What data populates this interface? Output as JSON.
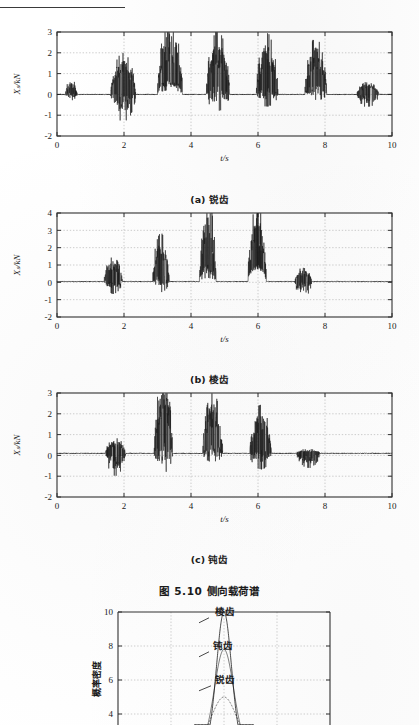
{
  "page": {
    "figure_caption": "图 5.10    侧向载荷谱",
    "header_rule": "horizontal-rule"
  },
  "subcaptions": {
    "a": "(a) 锐齿",
    "b": "(b) 棱齿",
    "c": "(c) 钝齿"
  },
  "chart_data": [
    {
      "id": "panel-a",
      "type": "line",
      "title": "(a) 锐齿",
      "xlabel": "t/s",
      "ylabel": "Xₛ/kN",
      "xlim": [
        0,
        10
      ],
      "ylim": [
        -2,
        3
      ],
      "xticks": [
        0,
        2,
        4,
        6,
        8,
        10
      ],
      "yticks": [
        -2,
        -1,
        0,
        1,
        2,
        3
      ],
      "xtick_labels": [
        "0",
        "2",
        "4",
        "6",
        "8",
        "10"
      ],
      "ytick_labels": [
        "-2",
        "-1",
        "0",
        "1",
        "2",
        "3"
      ],
      "grid": true,
      "legend": "none",
      "series": [
        {
          "name": "lateral load - sharp tooth",
          "description": "Burst-type random signal: quiet baseline near 0 with six high-amplitude impact clusters",
          "bursts": [
            {
              "t_start": 0.25,
              "t_end": 0.6,
              "peak_pos": 0.55,
              "peak_neg": -0.45
            },
            {
              "t_start": 1.6,
              "t_end": 2.35,
              "peak_pos": 1.5,
              "peak_neg": -1.8
            },
            {
              "t_start": 3.0,
              "t_end": 3.75,
              "peak_pos": 2.75,
              "peak_neg": -0.7
            },
            {
              "t_start": 4.45,
              "t_end": 5.15,
              "peak_pos": 2.3,
              "peak_neg": -1.55
            },
            {
              "t_start": 5.95,
              "t_end": 6.6,
              "peak_pos": 2.2,
              "peak_neg": -1.3
            },
            {
              "t_start": 7.4,
              "t_end": 8.05,
              "peak_pos": 2.05,
              "peak_neg": -0.95
            },
            {
              "t_start": 8.95,
              "t_end": 9.6,
              "peak_pos": 0.45,
              "peak_neg": -0.75
            }
          ],
          "baseline": 0.0
        }
      ]
    },
    {
      "id": "panel-b",
      "type": "line",
      "title": "(b) 棱齿",
      "xlabel": "t/s",
      "ylabel": "Xₛ/kN",
      "xlim": [
        0,
        10
      ],
      "ylim": [
        -2,
        4
      ],
      "xticks": [
        0,
        2,
        4,
        6,
        8,
        10
      ],
      "yticks": [
        -2,
        -1,
        0,
        1,
        2,
        3,
        4
      ],
      "xtick_labels": [
        "0",
        "2",
        "4",
        "6",
        "8",
        "10"
      ],
      "ytick_labels": [
        "-2",
        "-1",
        "0",
        "1",
        "2",
        "3",
        "4"
      ],
      "grid": true,
      "legend": "none",
      "series": [
        {
          "name": "lateral load - ridge tooth",
          "description": "Quiet baseline with four main impact clusters reaching ~3.6 kN",
          "bursts": [
            {
              "t_start": 1.4,
              "t_end": 1.95,
              "peak_pos": 1.05,
              "peak_neg": -1.05
            },
            {
              "t_start": 2.85,
              "t_end": 3.35,
              "peak_pos": 2.1,
              "peak_neg": -1.3
            },
            {
              "t_start": 4.25,
              "t_end": 4.75,
              "peak_pos": 3.65,
              "peak_neg": -1.0
            },
            {
              "t_start": 5.7,
              "t_end": 6.25,
              "peak_pos": 3.35,
              "peak_neg": -0.55
            },
            {
              "t_start": 7.1,
              "t_end": 7.6,
              "peak_pos": 0.6,
              "peak_neg": -1.15
            }
          ],
          "baseline": 0.05
        }
      ]
    },
    {
      "id": "panel-c",
      "type": "line",
      "title": "(c) 钝齿",
      "xlabel": "t/s",
      "ylabel": "Xₛ/kN",
      "xlim": [
        0,
        10
      ],
      "ylim": [
        -2,
        3
      ],
      "xticks": [
        0,
        2,
        4,
        6,
        8,
        10
      ],
      "yticks": [
        -2,
        -1,
        0,
        1,
        2,
        3
      ],
      "xtick_labels": [
        "0",
        "2",
        "4",
        "6",
        "8",
        "10"
      ],
      "ytick_labels": [
        "-2",
        "-1",
        "0",
        "1",
        "2",
        "3"
      ],
      "grid": true,
      "legend": "none",
      "series": [
        {
          "name": "lateral load - blunt tooth",
          "description": "Broad negative dip near t=1.6-2.0 then three positive impact clusters",
          "bursts": [
            {
              "t_start": 1.45,
              "t_end": 2.05,
              "peak_pos": 0.55,
              "peak_neg": -1.25
            },
            {
              "t_start": 2.9,
              "t_end": 3.45,
              "peak_pos": 2.85,
              "peak_neg": -1.9
            },
            {
              "t_start": 4.35,
              "t_end": 4.95,
              "peak_pos": 2.2,
              "peak_neg": -1.15
            },
            {
              "t_start": 5.75,
              "t_end": 6.4,
              "peak_pos": 1.75,
              "peak_neg": -1.35
            },
            {
              "t_start": 7.15,
              "t_end": 7.85,
              "peak_pos": 0.15,
              "peak_neg": -0.75
            }
          ],
          "baseline": 0.1
        }
      ]
    },
    {
      "id": "panel-d",
      "type": "line",
      "title": "",
      "xlabel": "",
      "ylabel": "概率密度",
      "xlim": [
        0,
        1
      ],
      "ylim": [
        2,
        10
      ],
      "yticks": [
        2,
        4,
        6,
        8,
        10
      ],
      "ytick_labels": [
        "2",
        "4",
        "6",
        "8",
        "10"
      ],
      "grid": true,
      "legend": "annotations",
      "annotations": [
        {
          "label": "棱齿",
          "peak": 10.0
        },
        {
          "label": "钝齿",
          "peak": 7.8
        },
        {
          "label": "锐齿",
          "peak": 5.0
        }
      ],
      "series": [
        {
          "name": "棱齿",
          "peak_height": 10.0,
          "peak_x": 0.5,
          "width": 0.035
        },
        {
          "name": "钝齿",
          "peak_height": 7.8,
          "peak_x": 0.5,
          "width": 0.045
        },
        {
          "name": "锐齿",
          "peak_height": 5.0,
          "peak_x": 0.5,
          "width": 0.06
        }
      ]
    }
  ],
  "colors": {
    "ink": "#1a1a1a",
    "grid": "#b8b8b8",
    "axis": "#303030",
    "paper": "#ffffff"
  }
}
